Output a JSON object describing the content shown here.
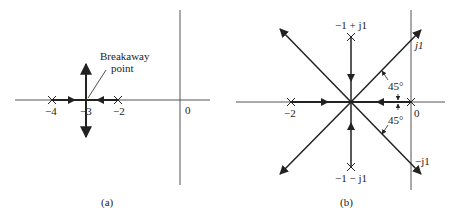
{
  "panel_a": {
    "caption": "(a)",
    "annotation": {
      "line1": "Breakaway",
      "line2": "point"
    },
    "tick_labels": {
      "minus4": "−4",
      "minus3": "−3",
      "minus2": "−2",
      "zero": "0"
    },
    "poles": [
      -4,
      -2
    ],
    "breakaway_point": -3
  },
  "panel_b": {
    "caption": "(b)",
    "tick_labels": {
      "minus2": "−2",
      "zero": "0"
    },
    "pole_labels": {
      "upper": "−1 + j1",
      "lower": "−1 − j1"
    },
    "axis_labels": {
      "pos_j": "j1",
      "neg_j": "−j1"
    },
    "angle_labels": {
      "upper": "45°",
      "lower": "45°"
    },
    "poles": [
      "0",
      "-2",
      "-1+j1",
      "-1-j1"
    ],
    "asymptote_center": -1
  },
  "colors": {
    "line": "#222222",
    "axis": "#555555"
  }
}
